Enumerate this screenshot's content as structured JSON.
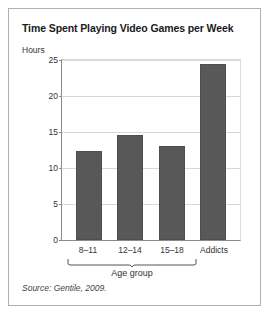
{
  "chart_data": {
    "type": "bar",
    "title": "Time Spent Playing Video Games per Week",
    "xlabel": "Age group",
    "ylabel": "Hours",
    "categories": [
      "8–11",
      "12–14",
      "15–18",
      "Addicts"
    ],
    "values": [
      12.4,
      14.6,
      13.0,
      24.5
    ],
    "ylim": [
      0,
      25
    ],
    "yticks": [
      0,
      5,
      10,
      15,
      20,
      25
    ],
    "ytick_labels": [
      "0",
      "5",
      "10",
      "15",
      "20",
      "25"
    ],
    "grid": true,
    "legend": "none",
    "group_bracket": {
      "label": "Age group",
      "spans_categories": [
        "8–11",
        "12–14",
        "15–18"
      ]
    },
    "bar_color": "#585858",
    "source": "Source: Gentile, 2009."
  }
}
